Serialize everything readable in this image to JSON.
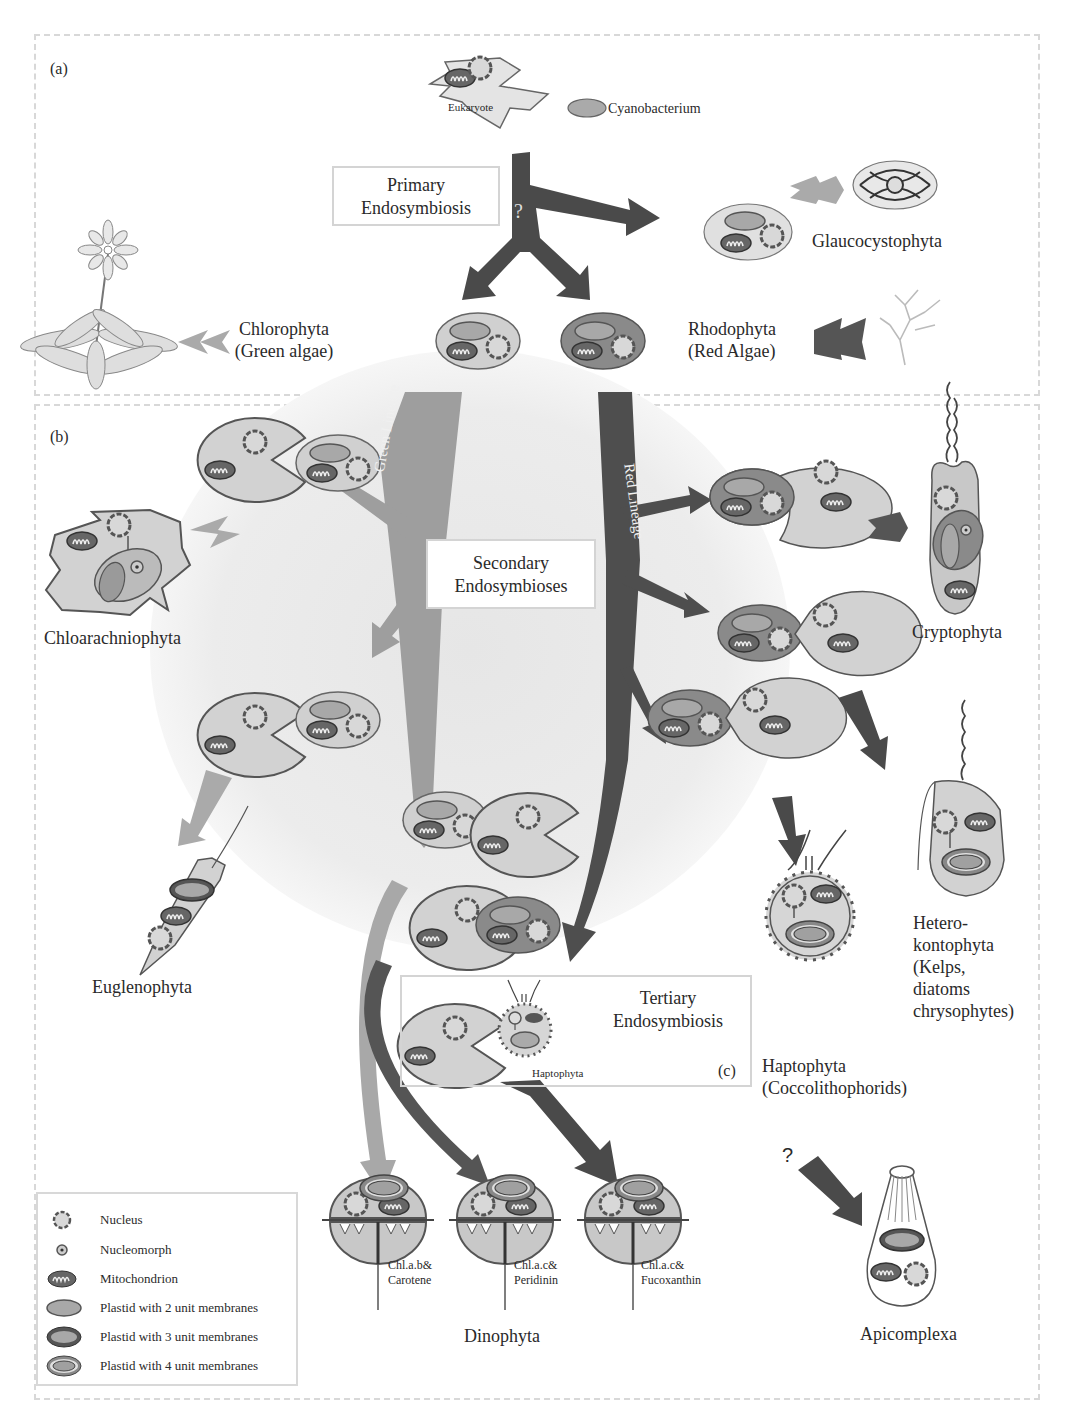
{
  "figure": {
    "panels": [
      {
        "id": "a",
        "label": "(a)"
      },
      {
        "id": "b",
        "label": "(b)"
      },
      {
        "id": "c",
        "label": "(c)"
      }
    ],
    "top": {
      "eukaryote_label": "Eukaryote",
      "cyanobacterium_label": "Cyanobacterium",
      "primary_box": [
        "Primary",
        "Endosymbiosis"
      ],
      "question_mark": "?"
    },
    "lineages": {
      "green": "Green Lineage",
      "red": "Red Lineage"
    },
    "secondary_box": [
      "Secondary",
      "Endosymbioses"
    ],
    "tertiary_box": [
      "Tertiary",
      "Endosymbiosis"
    ],
    "tertiary_partner_label": "Haptophyta",
    "groups": {
      "glaucocystophyta": "Glaucocystophyta",
      "chlorophyta": [
        "Chlorophyta",
        "(Green algae)"
      ],
      "rhodophyta": [
        "Rhodophyta",
        "(Red Algae)"
      ],
      "chloarachniophyta": "Chloarachniophyta",
      "euglenophyta": "Euglenophyta",
      "cryptophyta": "Cryptophyta",
      "heterokontophyta": [
        "Hetero-",
        "kontophyta",
        "(Kelps,",
        "diatoms",
        "chrysophytes)"
      ],
      "haptophyta": [
        "Haptophyta",
        "(Coccolithophorids)"
      ],
      "dinophyta": "Dinophyta",
      "apicomplexa": "Apicomplexa",
      "apicomplexa_question": "?"
    },
    "dinophyta_pigments": [
      [
        "Chl.a.b&",
        "Carotene"
      ],
      [
        "Chl.a.c&",
        "Peridinin"
      ],
      [
        "Chl.a.c&",
        "Fucoxanthin"
      ]
    ],
    "legend": [
      {
        "icon": "nucleus-icon",
        "label": "Nucleus"
      },
      {
        "icon": "nucleomorph-icon",
        "label": "Nucleomorph"
      },
      {
        "icon": "mitochondrion-icon",
        "label": "Mitochondrion"
      },
      {
        "icon": "plastid-2-membrane-icon",
        "label": "Plastid  with 2 unit membranes"
      },
      {
        "icon": "plastid-3-membrane-icon",
        "label": "Plastid  with 3 unit membranes"
      },
      {
        "icon": "plastid-4-membrane-icon",
        "label": "Plastid  with 4 unit membranes"
      }
    ],
    "colors": {
      "green_lineage": "#9e9e9e",
      "red_lineage": "#555555",
      "cell_fill": "#d2d2d2",
      "red_cell_fill": "#8a8a8a",
      "outline": "#555555",
      "background_blob": "#ececec"
    }
  }
}
